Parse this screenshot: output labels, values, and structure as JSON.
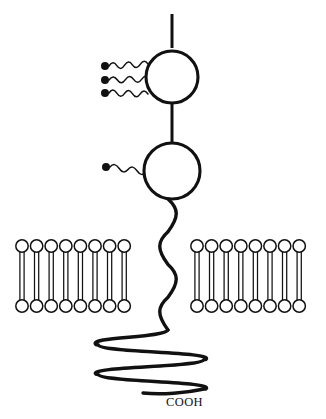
{
  "figure": {
    "background_color": "#ffffff",
    "stroke_color": "#111111",
    "width": 326,
    "height": 419
  },
  "labels": {
    "c_terminus": "COOH"
  },
  "n_terminal_stalk": {
    "name": "n-terminal-stalk",
    "x": 172,
    "y_top": 14,
    "y_bottom": 48
  },
  "domains": [
    {
      "name": "upper-globular-domain",
      "cx": 172,
      "cy": 77,
      "r": 26
    },
    {
      "name": "lower-globular-domain",
      "cx": 172,
      "cy": 171,
      "r": 28
    }
  ],
  "interdomain_linker": {
    "name": "interdomain-linker",
    "x": 172,
    "y_top": 103,
    "y_bottom": 143
  },
  "glycans": [
    {
      "name": "glycan-chain-1",
      "dot_x": 105,
      "dot_y": 66,
      "end_x": 148,
      "end_y": 64,
      "dot_r": 4.0,
      "waves": 5
    },
    {
      "name": "glycan-chain-2",
      "dot_x": 105,
      "dot_y": 80,
      "end_x": 150,
      "end_y": 79,
      "dot_r": 4.0,
      "waves": 5
    },
    {
      "name": "glycan-chain-3",
      "dot_x": 105,
      "dot_y": 93,
      "end_x": 148,
      "end_y": 94,
      "dot_r": 4.0,
      "waves": 5
    },
    {
      "name": "glycan-chain-4",
      "dot_x": 106,
      "dot_y": 167,
      "end_x": 146,
      "end_y": 172,
      "dot_r": 4.0,
      "waves": 4
    }
  ],
  "transmembrane_segment": {
    "name": "transmembrane-helix",
    "x_center": 168,
    "y_start": 199,
    "y_end": 330,
    "amplitude": 11,
    "turns": 4
  },
  "cytoplasmic_coil": {
    "name": "cytoplasmic-coil",
    "x_left": 96,
    "x_right": 206,
    "y_top": 330,
    "y_bottom": 389,
    "passes": 4
  },
  "membrane": {
    "name": "lipid-bilayer",
    "outer_head_cy": 246,
    "inner_head_cy": 306,
    "head_r": 6.2,
    "tail_top": 252,
    "tail_bottom": 300,
    "tail_offset": 2.1,
    "leaflets": [
      {
        "name": "bilayer-left-patch",
        "x_start": 22,
        "spacing": 14.6,
        "count": 8
      },
      {
        "name": "bilayer-right-patch",
        "x_start": 197,
        "spacing": 14.6,
        "count": 8
      }
    ]
  },
  "c_terminus_label": {
    "x": 166,
    "y": 406
  }
}
